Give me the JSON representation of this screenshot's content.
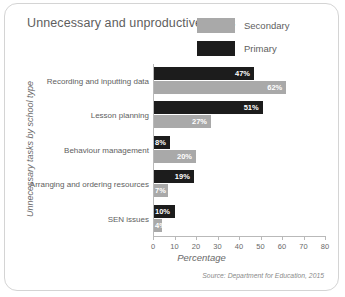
{
  "chart_data": {
    "type": "bar",
    "orientation": "horizontal",
    "title": "Unnecessary and unproductive tasks",
    "xlabel": "Percentage",
    "ylabel": "Unnecessary tasks by school type",
    "categories": [
      "Recording and inputting data",
      "Lesson planning",
      "Behaviour management",
      "Arranging and ordering resources",
      "SEN issues"
    ],
    "series": [
      {
        "name": "Primary",
        "color": "#1c1c1c",
        "values": [
          47,
          51,
          8,
          19,
          10
        ],
        "labels": [
          "47%",
          "51%",
          "8%",
          "19%",
          "10%"
        ]
      },
      {
        "name": "Secondary",
        "color": "#a9a9a9",
        "values": [
          62,
          27,
          20,
          7,
          4
        ],
        "labels": [
          "62%",
          "27%",
          "20%",
          "7%",
          "4%"
        ]
      }
    ],
    "series_order_top_to_bottom": [
      "Primary",
      "Secondary"
    ],
    "xlim": [
      0,
      80
    ],
    "xticks": [
      0,
      10,
      20,
      30,
      40,
      50,
      60,
      70,
      80
    ],
    "xtick_labels": [
      "0",
      "10",
      "20",
      "30",
      "40",
      "50",
      "60",
      "70",
      "80"
    ],
    "grid": false,
    "legend_position": "top-right",
    "source": "Source: Department for Education, 2015"
  },
  "legend": {
    "items": [
      {
        "label": "Secondary",
        "color": "#a9a9a9"
      },
      {
        "label": "Primary",
        "color": "#1c1c1c"
      }
    ]
  }
}
